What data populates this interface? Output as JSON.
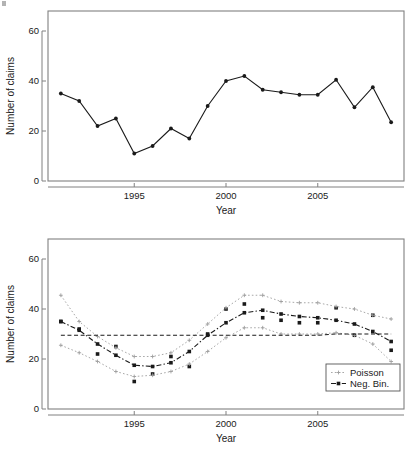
{
  "figure": {
    "background": "#ffffff",
    "frame_color": "#808080",
    "series_color_observed": "#1a1a1a",
    "series_color_poisson": "#9e9e9e",
    "series_color_negbin": "#1a1a1a",
    "reference_line_color": "#1a1a1a"
  },
  "panels": [
    {
      "id": "top",
      "name": "observed-claims-panel",
      "xlabel": "Year",
      "ylabel": "Number of claims",
      "xticks": [
        "1995",
        "2000",
        "2005"
      ],
      "yticks": [
        "0",
        "20",
        "40",
        "60"
      ]
    },
    {
      "id": "bottom",
      "name": "fitted-models-panel",
      "xlabel": "Year",
      "ylabel": "Number of claims",
      "xticks": [
        "1995",
        "2000",
        "2005"
      ],
      "yticks": [
        "0",
        "20",
        "40",
        "60"
      ],
      "legend": {
        "name": "model-legend",
        "items": [
          {
            "label": "Poisson",
            "color": "#9e9e9e",
            "marker": "plus"
          },
          {
            "label": "Neg. Bin.",
            "color": "#1a1a1a",
            "marker": "square"
          }
        ]
      }
    }
  ],
  "chart_data": [
    {
      "type": "line",
      "id": "top",
      "title": "",
      "xlabel": "Year",
      "ylabel": "Number of claims",
      "xlim": [
        1990.3,
        2009.7
      ],
      "ylim": [
        0,
        68
      ],
      "xticks": [
        1995,
        2000,
        2005
      ],
      "yticks": [
        0,
        20,
        40,
        60
      ],
      "grid": false,
      "legend": "none",
      "x": [
        1991,
        1992,
        1993,
        1994,
        1995,
        1996,
        1997,
        1998,
        1999,
        2000,
        2001,
        2002,
        2003,
        2004,
        2005,
        2006,
        2007,
        2008,
        2009
      ],
      "series": [
        {
          "name": "Observed number of claims",
          "marker": "filled-circle",
          "color": "#1a1a1a",
          "linestyle": "solid",
          "values": [
            35,
            32,
            22,
            25,
            11,
            14,
            21,
            17,
            30,
            40,
            42,
            36.5,
            35.5,
            34.5,
            34.5,
            40.5,
            29.5,
            37.5,
            23.5
          ]
        }
      ]
    },
    {
      "type": "line",
      "id": "bottom",
      "title": "",
      "xlabel": "Year",
      "ylabel": "Number of claims",
      "xlim": [
        1990.3,
        2009.7
      ],
      "ylim": [
        0,
        68
      ],
      "xticks": [
        1995,
        2000,
        2005
      ],
      "yticks": [
        0,
        20,
        40,
        60
      ],
      "grid": false,
      "legend": "bottom-right",
      "x": [
        1991,
        1992,
        1993,
        1994,
        1995,
        1996,
        1997,
        1998,
        1999,
        2000,
        2001,
        2002,
        2003,
        2004,
        2005,
        2006,
        2007,
        2008,
        2009
      ],
      "series": [
        {
          "name": "Observed",
          "marker": "filled-square",
          "color": "#1a1a1a",
          "linestyle": "none",
          "values": [
            35,
            32,
            22,
            25,
            11,
            14,
            21,
            17,
            30,
            40,
            42,
            36.5,
            35.5,
            34.5,
            34.5,
            40.5,
            29.5,
            37.5,
            23.5
          ]
        },
        {
          "name": "Neg. Bin.",
          "marker": "filled-square",
          "color": "#1a1a1a",
          "linestyle": "dashdot",
          "values": [
            35,
            31.5,
            26,
            21.5,
            17.5,
            17,
            18.5,
            23,
            29.5,
            34.5,
            38.5,
            39.5,
            38,
            37,
            36.5,
            35.5,
            34,
            31,
            27
          ]
        },
        {
          "name": "Poisson upper",
          "marker": "plus",
          "color": "#9e9e9e",
          "linestyle": "dotted",
          "values": [
            45.5,
            35,
            29,
            24.5,
            21,
            21,
            22.5,
            27.5,
            34,
            40.5,
            45.5,
            45.5,
            43,
            42.5,
            42.5,
            41,
            40,
            37.5,
            36
          ]
        },
        {
          "name": "Poisson lower",
          "marker": "plus",
          "color": "#9e9e9e",
          "linestyle": "dotted",
          "values": [
            25.5,
            22.5,
            19,
            15,
            13,
            13.5,
            15,
            18,
            23,
            28.5,
            32.5,
            32.5,
            30,
            30,
            30,
            30.5,
            29.5,
            26,
            19
          ]
        },
        {
          "name": "Reference level",
          "marker": "none",
          "color": "#1a1a1a",
          "linestyle": "dashed",
          "values": [
            29.5,
            29.5,
            29.5,
            29.5,
            29.5,
            29.5,
            29.5,
            29.5,
            29.5,
            29.5,
            29.5,
            29.5,
            29.5,
            29.5,
            29.5,
            30,
            30,
            30,
            30
          ]
        }
      ]
    }
  ]
}
